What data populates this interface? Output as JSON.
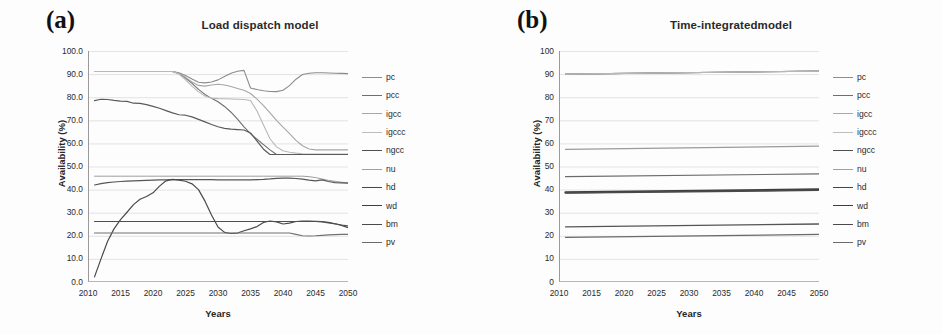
{
  "figure": {
    "panels": [
      {
        "tag": "(a)",
        "title": "Load dispatch model",
        "xlabel": "Years",
        "ylabel": "Availability (%)"
      },
      {
        "tag": "(b)",
        "title": "Time-integratedmodel",
        "xlabel": "Years",
        "ylabel": "Availability (%)"
      }
    ]
  },
  "chart_data": [
    {
      "type": "line",
      "title": "Load dispatch model",
      "panel": "(a)",
      "xlabel": "Years",
      "ylabel": "Availability (%)",
      "xlim": [
        2010,
        2050
      ],
      "ylim": [
        0,
        100
      ],
      "xticks": [
        2010,
        2015,
        2020,
        2025,
        2030,
        2035,
        2040,
        2045,
        2050
      ],
      "yticks": [
        0.0,
        10.0,
        20.0,
        30.0,
        40.0,
        50.0,
        60.0,
        70.0,
        80.0,
        90.0,
        100.0
      ],
      "ytick_labels": [
        "0.0",
        "10.0",
        "20.0",
        "30.0",
        "40.0",
        "50.0",
        "60.0",
        "70.0",
        "80.0",
        "90.0",
        "100.0"
      ],
      "xtick_labels": [
        "2010",
        "2015",
        "2020",
        "2025",
        "2030",
        "2035",
        "2040",
        "2045",
        "2050"
      ],
      "grid": true,
      "legend_position": "right",
      "x": [
        2011,
        2012,
        2013,
        2014,
        2015,
        2016,
        2017,
        2018,
        2019,
        2020,
        2021,
        2022,
        2023,
        2024,
        2025,
        2026,
        2027,
        2028,
        2029,
        2030,
        2031,
        2032,
        2033,
        2034,
        2035,
        2036,
        2037,
        2038,
        2039,
        2040,
        2041,
        2042,
        2043,
        2044,
        2045,
        2046,
        2047,
        2048,
        2049,
        2050
      ],
      "series": [
        {
          "name": "pc",
          "color": "#8c8c8c",
          "width": 1.1,
          "values": [
            91.1,
            91.1,
            91.1,
            91.1,
            91.1,
            91.1,
            91.1,
            91.1,
            91.1,
            91.1,
            91.1,
            91.1,
            91.1,
            90.6,
            89.4,
            87.9,
            86.5,
            86.2,
            86.6,
            87.5,
            89.0,
            90.4,
            91.2,
            91.6,
            84.0,
            83.3,
            82.8,
            82.5,
            82.4,
            83.0,
            85.0,
            87.8,
            89.8,
            90.4,
            90.6,
            90.6,
            90.5,
            90.4,
            90.3,
            90.2
          ]
        },
        {
          "name": "pcc",
          "color": "#6e6e6e",
          "width": 1.1,
          "values": [
            91.1,
            91.1,
            91.1,
            91.1,
            91.1,
            91.1,
            91.1,
            91.1,
            91.1,
            91.1,
            91.1,
            91.1,
            91.1,
            90.2,
            88.3,
            86.0,
            83.4,
            81.2,
            79.5,
            78.0,
            76.0,
            73.5,
            70.5,
            67.2,
            64.2,
            61.8,
            59.5,
            57.2,
            55.2,
            55.2,
            55.2,
            55.2,
            55.2,
            55.2,
            55.2,
            55.2,
            55.2,
            55.2,
            55.2,
            55.2
          ]
        },
        {
          "name": "igcc",
          "color": "#a6a6a6",
          "width": 1.1,
          "values": [
            91.1,
            91.1,
            91.1,
            91.1,
            91.1,
            91.1,
            91.1,
            91.1,
            91.1,
            91.1,
            91.1,
            91.1,
            91.1,
            90.4,
            88.6,
            86.6,
            85.1,
            84.8,
            85.3,
            85.6,
            85.3,
            84.6,
            83.8,
            83.0,
            81.6,
            79.2,
            76.4,
            73.2,
            70.0,
            67.0,
            64.2,
            61.3,
            59.0,
            57.6,
            57.2,
            57.2,
            57.2,
            57.2,
            57.2,
            57.2
          ]
        },
        {
          "name": "igccc",
          "color": "#b8b8b8",
          "width": 1.1,
          "values": [
            91.1,
            91.1,
            91.1,
            91.1,
            91.1,
            91.1,
            91.1,
            91.1,
            91.1,
            91.1,
            91.1,
            91.1,
            91.1,
            90.0,
            87.5,
            84.8,
            82.3,
            80.5,
            79.6,
            79.4,
            79.3,
            79.2,
            79.1,
            79.0,
            78.6,
            74.0,
            68.0,
            62.0,
            58.5,
            56.8,
            56.2,
            55.8,
            55.5,
            55.4,
            55.4,
            55.4,
            55.4,
            55.4,
            55.4,
            55.4
          ]
        },
        {
          "name": "ngcc",
          "color": "#5a5a5a",
          "width": 1.2,
          "values": [
            78.5,
            79.1,
            79.0,
            78.6,
            78.3,
            78.2,
            77.4,
            77.3,
            76.8,
            76.0,
            75.2,
            74.2,
            73.2,
            72.4,
            72.2,
            71.5,
            70.4,
            69.3,
            68.2,
            67.2,
            66.5,
            66.2,
            66.0,
            65.8,
            64.5,
            61.0,
            57.5,
            55.2,
            55.2,
            55.2,
            55.2,
            55.2,
            55.2,
            55.2,
            55.2,
            55.2,
            55.2,
            55.2,
            55.2,
            55.2
          ]
        },
        {
          "name": "nu",
          "color": "#9e9e9e",
          "width": 1.0,
          "values": [
            45.8,
            45.8,
            45.8,
            45.8,
            45.8,
            45.8,
            45.8,
            45.8,
            45.8,
            45.8,
            45.8,
            45.8,
            45.8,
            45.8,
            45.8,
            45.8,
            45.8,
            45.8,
            45.8,
            45.8,
            45.8,
            45.8,
            45.8,
            45.8,
            45.8,
            45.8,
            45.8,
            45.8,
            45.8,
            45.8,
            45.8,
            45.8,
            45.8,
            45.6,
            45.2,
            44.6,
            44.0,
            43.6,
            43.2,
            42.9
          ]
        },
        {
          "name": "hd",
          "color": "#555555",
          "width": 1.2,
          "values": [
            42.0,
            42.6,
            43.0,
            43.3,
            43.5,
            43.7,
            43.8,
            43.9,
            44.0,
            44.1,
            44.2,
            44.2,
            44.3,
            44.3,
            44.3,
            44.3,
            44.3,
            44.3,
            44.3,
            44.2,
            44.2,
            44.2,
            44.2,
            44.2,
            44.2,
            44.3,
            44.4,
            44.6,
            44.9,
            45.0,
            45.0,
            44.8,
            44.5,
            44.1,
            43.8,
            44.2,
            43.5,
            43.0,
            42.9,
            42.8
          ]
        },
        {
          "name": "wd",
          "color": "#4a4a4a",
          "width": 1.2,
          "values": [
            2.2,
            10.0,
            17.5,
            23.0,
            27.0,
            30.2,
            33.5,
            35.8,
            37.0,
            38.6,
            41.5,
            43.8,
            44.4,
            44.1,
            43.6,
            42.5,
            40.0,
            35.0,
            29.0,
            23.8,
            21.5,
            21.0,
            21.2,
            22.2,
            23.0,
            24.0,
            25.8,
            26.4,
            26.0,
            25.1,
            25.5,
            26.2,
            26.4,
            26.4,
            26.3,
            26.2,
            25.8,
            25.2,
            24.5,
            23.5
          ]
        },
        {
          "name": "bm",
          "color": "#4f4f4f",
          "width": 1.1,
          "values": [
            26.2,
            26.2,
            26.2,
            26.2,
            26.2,
            26.2,
            26.2,
            26.2,
            26.2,
            26.2,
            26.2,
            26.2,
            26.2,
            26.2,
            26.2,
            26.2,
            26.2,
            26.2,
            26.2,
            26.2,
            26.2,
            26.2,
            26.2,
            26.2,
            26.2,
            26.2,
            26.2,
            26.2,
            26.2,
            26.2,
            26.2,
            26.2,
            26.2,
            26.2,
            26.2,
            26.0,
            25.6,
            25.2,
            24.7,
            24.3
          ]
        },
        {
          "name": "pv",
          "color": "#707070",
          "width": 1.1,
          "values": [
            21.2,
            21.2,
            21.2,
            21.2,
            21.2,
            21.2,
            21.2,
            21.2,
            21.2,
            21.2,
            21.2,
            21.2,
            21.2,
            21.2,
            21.2,
            21.2,
            21.2,
            21.2,
            21.2,
            21.2,
            21.2,
            21.2,
            21.2,
            21.2,
            21.2,
            21.2,
            21.2,
            21.2,
            21.2,
            21.2,
            21.2,
            20.6,
            20.0,
            19.9,
            20.0,
            20.2,
            20.4,
            20.5,
            20.6,
            20.6
          ]
        }
      ],
      "legend": [
        "pc",
        "pcc",
        "igcc",
        "igccc",
        "ngcc",
        "nu",
        "hd",
        "wd",
        "bm",
        "pv"
      ]
    },
    {
      "type": "line",
      "title": "Time-integratedmodel",
      "panel": "(b)",
      "xlabel": "Years",
      "ylabel": "Availability (%)",
      "xlim": [
        2010,
        2050
      ],
      "ylim": [
        0,
        100
      ],
      "xticks": [
        2010,
        2015,
        2020,
        2025,
        2030,
        2035,
        2040,
        2045,
        2050
      ],
      "yticks": [
        0,
        10,
        20,
        30,
        40,
        50,
        60,
        70,
        80,
        90,
        100
      ],
      "ytick_labels": [
        "0",
        "10",
        "20",
        "30",
        "40",
        "50",
        "60",
        "70",
        "80",
        "90",
        "100"
      ],
      "xtick_labels": [
        "2010",
        "2015",
        "2020",
        "2025",
        "2030",
        "2035",
        "2040",
        "2045",
        "2050"
      ],
      "grid": true,
      "legend_position": "right",
      "x": [
        2011,
        2050
      ],
      "series": [
        {
          "name": "pc",
          "color": "#8c8c8c",
          "width": 1.2,
          "values": [
            90.0,
            91.3
          ]
        },
        {
          "name": "pcc",
          "color": "#6e6e6e",
          "width": 1.2,
          "values": [
            90.0,
            91.3
          ]
        },
        {
          "name": "igcc",
          "color": "#a6a6a6",
          "width": 1.1,
          "values": [
            90.0,
            91.3
          ]
        },
        {
          "name": "igccc",
          "color": "#b8b8b8",
          "width": 1.1,
          "values": [
            90.0,
            91.3
          ]
        },
        {
          "name": "ngcc",
          "color": "#9a9a9a",
          "width": 1.1,
          "values": [
            57.4,
            58.8
          ]
        },
        {
          "name": "nu",
          "color": "#6a6a6a",
          "width": 1.2,
          "values": [
            45.6,
            46.8
          ]
        },
        {
          "name": "hd",
          "color": "#3d3d3d",
          "width": 2.2,
          "values": [
            38.8,
            40.1
          ]
        },
        {
          "name": "wd",
          "color": "#4a4a4a",
          "width": 1.6,
          "values": [
            38.6,
            39.7
          ]
        },
        {
          "name": "bm",
          "color": "#555555",
          "width": 1.3,
          "values": [
            23.9,
            25.1
          ]
        },
        {
          "name": "pv",
          "color": "#6a6a6a",
          "width": 1.3,
          "values": [
            19.3,
            20.6
          ]
        }
      ],
      "legend": [
        "pc",
        "pcc",
        "igcc",
        "igccc",
        "ngcc",
        "nu",
        "hd",
        "wd",
        "bm",
        "pv"
      ]
    }
  ],
  "legend_styles": [
    {
      "name": "pc",
      "color": "#8c8c8c",
      "width": 1.4
    },
    {
      "name": "pcc",
      "color": "#6e6e6e",
      "width": 1.4
    },
    {
      "name": "igcc",
      "color": "#a8a8a8",
      "width": 1.2
    },
    {
      "name": "igccc",
      "color": "#bdbdbd",
      "width": 1.2
    },
    {
      "name": "ngcc",
      "color": "#4f4f4f",
      "width": 1.8
    },
    {
      "name": "nu",
      "color": "#a0a0a0",
      "width": 1.1
    },
    {
      "name": "hd",
      "color": "#474747",
      "width": 1.8
    },
    {
      "name": "wd",
      "color": "#3f3f3f",
      "width": 1.9
    },
    {
      "name": "bm",
      "color": "#4a4a4a",
      "width": 1.8
    },
    {
      "name": "pv",
      "color": "#6b6b6b",
      "width": 1.5
    }
  ]
}
